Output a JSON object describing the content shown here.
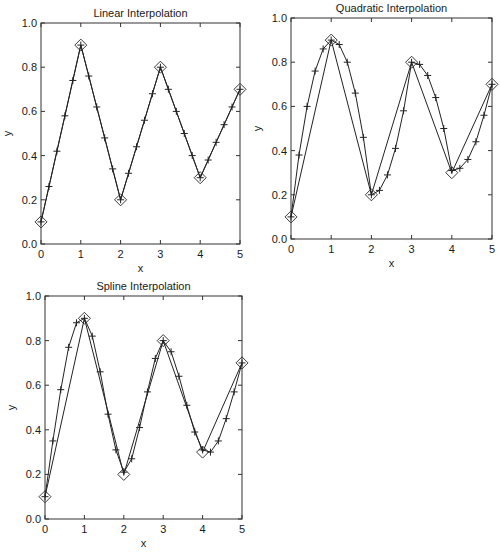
{
  "chart_data": [
    {
      "type": "line",
      "title": "Linear Interpolation",
      "xlabel": "x",
      "ylabel": "y",
      "xlim": [
        0,
        5
      ],
      "ylim": [
        0.0,
        1.0
      ],
      "xticks": [
        "0",
        "1",
        "2",
        "3",
        "4",
        "5"
      ],
      "yticks": [
        "0.0",
        "0.2",
        "0.4",
        "0.6",
        "0.8",
        "1.0"
      ],
      "grid": false,
      "legend": null,
      "box": {
        "left": 41,
        "top": 23,
        "right": 240,
        "bottom": 244
      },
      "series": [
        {
          "name": "data points",
          "marker": "diamond",
          "line": true,
          "x": [
            0,
            1,
            2,
            3,
            4,
            5
          ],
          "values": [
            0.1,
            0.9,
            0.2,
            0.8,
            0.3,
            0.7
          ]
        },
        {
          "name": "linear interpolated",
          "marker": "plus",
          "line": true,
          "x": [
            0.0,
            0.2,
            0.4,
            0.6,
            0.8,
            1.0,
            1.2,
            1.4,
            1.6,
            1.8,
            2.0,
            2.2,
            2.4,
            2.6,
            2.8,
            3.0,
            3.2,
            3.4,
            3.6,
            3.8,
            4.0,
            4.2,
            4.4,
            4.6,
            4.8,
            5.0
          ],
          "values": [
            0.1,
            0.26,
            0.42,
            0.58,
            0.74,
            0.9,
            0.76,
            0.62,
            0.48,
            0.34,
            0.2,
            0.32,
            0.44,
            0.56,
            0.68,
            0.8,
            0.7,
            0.6,
            0.5,
            0.4,
            0.3,
            0.38,
            0.46,
            0.54,
            0.62,
            0.7
          ]
        }
      ]
    },
    {
      "type": "line",
      "title": "Quadratic Interpolation",
      "xlabel": "x",
      "ylabel": "y",
      "xlim": [
        0,
        5
      ],
      "ylim": [
        0.0,
        1.0
      ],
      "xticks": [
        "0",
        "1",
        "2",
        "3",
        "4",
        "5"
      ],
      "yticks": [
        "0.0",
        "0.2",
        "0.4",
        "0.6",
        "0.8",
        "1.0"
      ],
      "grid": false,
      "legend": null,
      "box": {
        "left": 291,
        "top": 18,
        "right": 492,
        "bottom": 239
      },
      "series": [
        {
          "name": "data points",
          "marker": "diamond",
          "line": true,
          "x": [
            0,
            1,
            2,
            3,
            4,
            5
          ],
          "values": [
            0.1,
            0.9,
            0.2,
            0.8,
            0.3,
            0.7
          ]
        },
        {
          "name": "quadratic interpolated",
          "marker": "plus",
          "line": true,
          "x": [
            0.0,
            0.2,
            0.4,
            0.6,
            0.8,
            1.0,
            1.2,
            1.4,
            1.6,
            1.8,
            2.0,
            2.2,
            2.4,
            2.6,
            2.8,
            3.0,
            3.2,
            3.4,
            3.6,
            3.8,
            4.0,
            4.2,
            4.4,
            4.6,
            4.8,
            5.0
          ],
          "values": [
            0.1,
            0.38,
            0.6,
            0.76,
            0.86,
            0.9,
            0.88,
            0.8,
            0.66,
            0.46,
            0.2,
            0.22,
            0.29,
            0.41,
            0.58,
            0.8,
            0.79,
            0.74,
            0.64,
            0.5,
            0.31,
            0.32,
            0.36,
            0.44,
            0.56,
            0.7
          ]
        }
      ]
    },
    {
      "type": "line",
      "title": "Spline Interpolation",
      "xlabel": "x",
      "ylabel": "y",
      "xlim": [
        0,
        5
      ],
      "ylim": [
        0.0,
        1.0
      ],
      "xticks": [
        "0",
        "1",
        "2",
        "3",
        "4",
        "5"
      ],
      "yticks": [
        "0.0",
        "0.2",
        "0.4",
        "0.6",
        "0.8",
        "1.0"
      ],
      "grid": false,
      "legend": null,
      "box": {
        "left": 45,
        "top": 296,
        "right": 242,
        "bottom": 519
      },
      "series": [
        {
          "name": "data points",
          "marker": "diamond",
          "line": true,
          "x": [
            0,
            1,
            2,
            3,
            4,
            5
          ],
          "values": [
            0.1,
            0.9,
            0.2,
            0.8,
            0.3,
            0.7
          ]
        },
        {
          "name": "spline interpolated",
          "marker": "plus",
          "line": true,
          "x": [
            0.0,
            0.2,
            0.4,
            0.6,
            0.8,
            1.0,
            1.2,
            1.4,
            1.6,
            1.8,
            2.0,
            2.2,
            2.4,
            2.6,
            2.8,
            3.0,
            3.2,
            3.4,
            3.6,
            3.8,
            4.0,
            4.2,
            4.4,
            4.6,
            4.8,
            5.0
          ],
          "values": [
            0.1,
            0.35,
            0.58,
            0.77,
            0.88,
            0.9,
            0.82,
            0.66,
            0.47,
            0.31,
            0.21,
            0.27,
            0.41,
            0.57,
            0.72,
            0.8,
            0.75,
            0.64,
            0.51,
            0.39,
            0.31,
            0.3,
            0.35,
            0.45,
            0.57,
            0.7
          ]
        }
      ]
    }
  ],
  "charts": [
    {
      "title": "Linear Interpolation",
      "xlabel": "x",
      "ylabel": "y"
    },
    {
      "title": "Quadratic Interpolation",
      "xlabel": "x",
      "ylabel": "y"
    },
    {
      "title": "Spline Interpolation",
      "xlabel": "x",
      "ylabel": "y"
    }
  ]
}
